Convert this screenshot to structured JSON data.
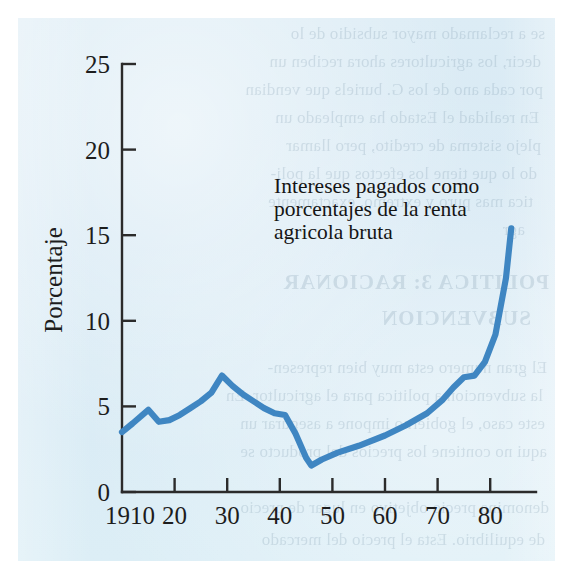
{
  "figure": {
    "background_color": "#dbedf5",
    "page_color": "#ffffff",
    "line_color": "#3f86c2",
    "axis_color": "#2b2b2b",
    "ghost_text": [
      "se a reclamado mayor subsidio de lo",
      "decir, los agricultores ahora reciben un",
      "por cada ano de los G. buriels que vendian",
      "En realidad el Estado ha empleado un",
      "plejo sistema de credito, pero llamar",
      "do lo que tiene los efectos que la poli-",
      "tica mas puro y extremo, exactamente",
      "agr",
      "POLITICA 3: RACIONAR",
      "SUBVENCION",
      "El gran numero esta muy bien represen-",
      "la subvencion a politica para el agricultor. En",
      "este caso, el gobierno impone a asegurar un",
      "aqui no contiene los precios del producto se",
      "denomina  precio objetivo  en lugar de precio",
      "de equilibrio. Esta el precio del mercado"
    ]
  },
  "chart_data": {
    "type": "line",
    "title": "",
    "annotation": {
      "lines": [
        "Intereses pagados como",
        "porcentajes de la renta",
        "agricola bruta"
      ]
    },
    "xlabel": "",
    "ylabel": "Porcentaje",
    "xlim": [
      1910,
      1985
    ],
    "ylim": [
      0,
      25
    ],
    "xticks": [
      1910,
      1920,
      1930,
      1940,
      1950,
      1960,
      1970,
      1980
    ],
    "xtick_labels": [
      "1910",
      "20",
      "30",
      "40",
      "50",
      "60",
      "70",
      "80"
    ],
    "yticks": [
      0,
      5,
      10,
      15,
      20,
      25
    ],
    "ytick_labels": [
      "0",
      "5",
      "10",
      "15",
      "20",
      "25"
    ],
    "grid": false,
    "legend": "none",
    "series": [
      {
        "name": "Intereses pagados como porcentajes de la renta agricola bruta",
        "color": "#3f86c2",
        "x": [
          1910,
          1912,
          1915,
          1917,
          1919,
          1921,
          1923,
          1925,
          1927,
          1929,
          1931,
          1933,
          1935,
          1937,
          1939,
          1941,
          1943,
          1945,
          1946,
          1948,
          1951,
          1955,
          1960,
          1964,
          1968,
          1971,
          1973,
          1975,
          1977,
          1979,
          1981,
          1983,
          1984
        ],
        "y": [
          3.5,
          4.0,
          4.8,
          4.1,
          4.2,
          4.5,
          4.9,
          5.3,
          5.8,
          6.8,
          6.2,
          5.7,
          5.3,
          4.9,
          4.6,
          4.5,
          3.4,
          2.0,
          1.55,
          1.9,
          2.3,
          2.7,
          3.3,
          3.9,
          4.6,
          5.4,
          6.1,
          6.7,
          6.8,
          7.6,
          9.2,
          12.5,
          15.4
        ]
      }
    ]
  }
}
